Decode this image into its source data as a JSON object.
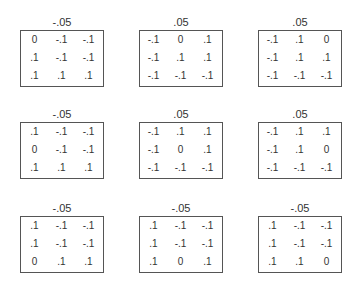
{
  "figure": {
    "panels": [
      {
        "title": "-.05",
        "rows": [
          [
            "0",
            "-.1",
            "-.1"
          ],
          [
            ".1",
            "-.1",
            "-.1"
          ],
          [
            ".1",
            ".1",
            ".1"
          ]
        ]
      },
      {
        "title": ".05",
        "rows": [
          [
            "-.1",
            "0",
            ".1"
          ],
          [
            "-.1",
            ".1",
            ".1"
          ],
          [
            "-.1",
            "-.1",
            "-.1"
          ]
        ]
      },
      {
        "title": ".05",
        "rows": [
          [
            "-.1",
            ".1",
            "0"
          ],
          [
            "-.1",
            ".1",
            ".1"
          ],
          [
            "-.1",
            "-.1",
            "-.1"
          ]
        ]
      },
      {
        "title": "-.05",
        "rows": [
          [
            ".1",
            "-.1",
            "-.1"
          ],
          [
            "0",
            "-.1",
            "-.1"
          ],
          [
            ".1",
            ".1",
            ".1"
          ]
        ]
      },
      {
        "title": ".05",
        "rows": [
          [
            "-.1",
            ".1",
            ".1"
          ],
          [
            "-.1",
            "0",
            ".1"
          ],
          [
            "-.1",
            "-.1",
            "-.1"
          ]
        ]
      },
      {
        "title": ".05",
        "rows": [
          [
            "-.1",
            ".1",
            ".1"
          ],
          [
            "-.1",
            ".1",
            "0"
          ],
          [
            "-.1",
            "-.1",
            "-.1"
          ]
        ]
      },
      {
        "title": "-.05",
        "rows": [
          [
            ".1",
            "-.1",
            "-.1"
          ],
          [
            ".1",
            "-.1",
            "-.1"
          ],
          [
            "0",
            ".1",
            ".1"
          ]
        ]
      },
      {
        "title": "-.05",
        "rows": [
          [
            ".1",
            "-.1",
            "-.1"
          ],
          [
            ".1",
            "-.1",
            "-.1"
          ],
          [
            ".1",
            "0",
            ".1"
          ]
        ]
      },
      {
        "title": "-.05",
        "rows": [
          [
            ".1",
            "-.1",
            "-.1"
          ],
          [
            ".1",
            "-.1",
            "-.1"
          ],
          [
            ".1",
            ".1",
            "0"
          ]
        ]
      }
    ]
  }
}
